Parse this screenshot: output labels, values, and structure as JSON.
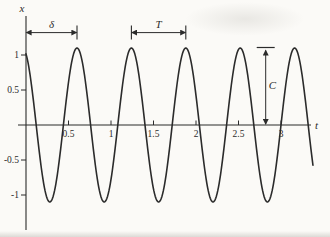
{
  "window": {
    "background": "#fbfaf7",
    "ink": "#2b2b2b"
  },
  "chart_data": {
    "type": "line",
    "title": "",
    "xlabel": "t",
    "ylabel": "x",
    "xlim": [
      0,
      3.5
    ],
    "ylim": [
      -1.35,
      1.5
    ],
    "grid": false,
    "x_ticks": [
      "0.5",
      "1",
      "1.5",
      "2",
      "2.5",
      "3"
    ],
    "y_ticks": [
      "1",
      "0.5",
      "-0.5",
      "-1"
    ],
    "series": [
      {
        "name": "x(t)",
        "function": "x(t) = C*cos(2*pi*(t - delta)/T)",
        "amplitude_C": 1.1,
        "period_T": 0.64,
        "peak_offset_delta": 0.6,
        "t_start": 0,
        "t_end": 3.38,
        "peak_times": [
          0.6,
          1.24,
          1.88,
          2.52,
          3.16
        ]
      }
    ],
    "annotations": [
      {
        "name": "delta-span",
        "label": "δ",
        "type": "h-span",
        "from_t": 0,
        "to_t": 0.6,
        "at_value": 1.32,
        "end_ticks": "right"
      },
      {
        "name": "period-span",
        "label": "T",
        "type": "h-span",
        "from_t": 1.24,
        "to_t": 1.88,
        "at_value": 1.32,
        "end_ticks": "both"
      },
      {
        "name": "amplitude-span",
        "label": "C",
        "type": "v-span",
        "at_t": 2.82,
        "from_value": 0,
        "to_value": 1.1,
        "top_bar": true
      }
    ]
  }
}
